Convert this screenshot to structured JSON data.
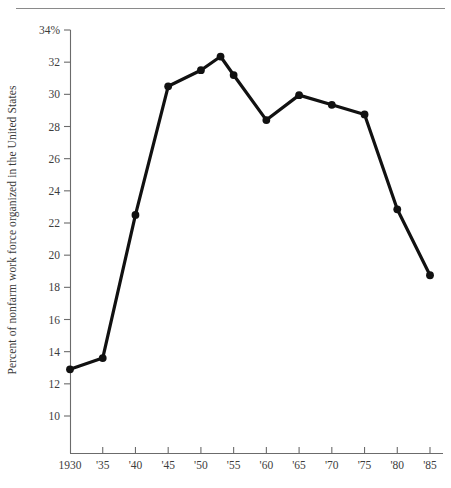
{
  "figure": {
    "top_rule": true,
    "background_color": "#ffffff",
    "line_color": "#111111",
    "axis_color": "#6b6b6b",
    "text_color": "#3d3d3d"
  },
  "chart_data": {
    "type": "line",
    "title": "",
    "xlabel": "",
    "ylabel": "Percent of nonfarm work force organized in the United States",
    "xlim": [
      1930,
      1985
    ],
    "ylim": [
      8.8,
      34.9
    ],
    "grid": false,
    "legend": null,
    "y_tick_values": [
      34,
      32,
      30,
      28,
      26,
      24,
      22,
      20,
      18,
      16,
      14,
      12,
      10
    ],
    "y_tick_labels": [
      "34%",
      "32",
      "30",
      "28",
      "26",
      "24",
      "22",
      "20",
      "18",
      "16",
      "14",
      "12",
      "10"
    ],
    "x_tick_values": [
      1930,
      1935,
      1940,
      1945,
      1950,
      1955,
      1960,
      1965,
      1970,
      1975,
      1980,
      1985
    ],
    "x_tick_labels": [
      "1930",
      "'35",
      "'40",
      "'45",
      "'50",
      "'55",
      "'60",
      "'65",
      "'70",
      "'75",
      "'80",
      "'85"
    ],
    "marker": "circle",
    "x": [
      1930,
      1935,
      1940,
      1945,
      1950,
      1953,
      1955,
      1960,
      1965,
      1970,
      1975,
      1980,
      1985
    ],
    "values": [
      12.9,
      13.6,
      22.5,
      30.5,
      31.5,
      32.35,
      31.2,
      28.4,
      29.95,
      29.35,
      28.75,
      22.85,
      18.75
    ],
    "series": [
      {
        "name": "Percent of nonfarm work force organized",
        "values": [
          12.9,
          13.6,
          22.5,
          30.5,
          31.5,
          32.35,
          31.2,
          28.4,
          29.95,
          29.35,
          28.75,
          22.85,
          18.75
        ]
      }
    ]
  }
}
